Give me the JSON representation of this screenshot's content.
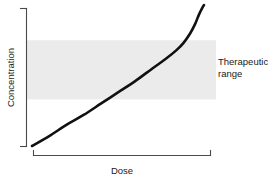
{
  "chart_data": {
    "type": "line",
    "title": "",
    "subtitle": "",
    "xlabel": "Dose",
    "ylabel": "Concentration",
    "grid": false,
    "legend_position": "none",
    "axis_style": "bracket",
    "xlim": [
      0,
      1
    ],
    "ylim": [
      0,
      1
    ],
    "xticks": [],
    "yticks": [],
    "xtick_labels": [],
    "ytick_labels": [],
    "series": [
      {
        "name": "dose-concentration curve",
        "color": "#111111",
        "line_width": 2.6,
        "shape": "shallow-linear-then-steep-exponential",
        "x": [
          0.0,
          0.1,
          0.2,
          0.3,
          0.4,
          0.5,
          0.6,
          0.7,
          0.78,
          0.84,
          0.88,
          0.92,
          0.95,
          0.97,
          0.99,
          1.0
        ],
        "y": [
          0.0,
          0.07,
          0.15,
          0.22,
          0.3,
          0.38,
          0.46,
          0.55,
          0.62,
          0.68,
          0.73,
          0.8,
          0.87,
          0.93,
          0.98,
          1.0
        ]
      }
    ],
    "shaded_regions": [
      {
        "name": "therapeutic-range-band",
        "orientation": "horizontal",
        "y_start": 0.33,
        "y_end": 0.75,
        "color": "#ebebeb",
        "label": "Therapeutic range"
      }
    ],
    "annotations": [
      {
        "name": "therapeutic-range-label",
        "lines": [
          "Therapeutic",
          "range"
        ],
        "color": "#1a1a1a"
      }
    ]
  },
  "annotation": {
    "line1": "Therapeutic",
    "line2": "range"
  },
  "colors": {
    "band": "#ebebeb",
    "curve": "#111111",
    "axis": "#4a4a4a",
    "text": "#1a1a1a",
    "background": "#ffffff"
  }
}
